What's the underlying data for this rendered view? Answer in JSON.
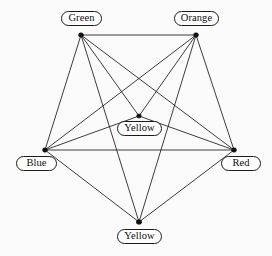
{
  "diagram": {
    "background_color": "#fbfbfb",
    "edge_color": "#1a1a1a",
    "node_color": "#111111",
    "label_border_color": "#1a1a1a",
    "label_fill_color": "#ffffff"
  },
  "nodes": [
    {
      "id": "green",
      "label": "Green",
      "x": 81,
      "y": 35,
      "label_x": 61,
      "label_y": 11,
      "label_w": 41,
      "label_h": 15,
      "dot_w": 5.0,
      "dot_h": 4.4
    },
    {
      "id": "orange",
      "label": "Orange",
      "x": 196,
      "y": 35,
      "label_x": 174,
      "label_y": 11,
      "label_w": 45,
      "label_h": 15,
      "dot_w": 5.0,
      "dot_h": 4.4
    },
    {
      "id": "yellow1",
      "label": "Yellow",
      "x": 139,
      "y": 116,
      "label_x": 117,
      "label_y": 121,
      "label_w": 45,
      "label_h": 15,
      "dot_w": 4.6,
      "dot_h": 4.2
    },
    {
      "id": "blue",
      "label": "Blue",
      "x": 45,
      "y": 150,
      "label_x": 16,
      "label_y": 156,
      "label_w": 41,
      "label_h": 15,
      "dot_w": 5.0,
      "dot_h": 4.4
    },
    {
      "id": "red",
      "label": "Red",
      "x": 234,
      "y": 150,
      "label_x": 221,
      "label_y": 156,
      "label_w": 40,
      "label_h": 15,
      "dot_w": 5.0,
      "dot_h": 4.4
    },
    {
      "id": "yellow2",
      "label": "Yellow",
      "x": 139,
      "y": 222,
      "label_x": 117,
      "label_y": 229,
      "label_w": 45,
      "label_h": 15,
      "dot_w": 5.4,
      "dot_h": 4.6
    }
  ],
  "edges": [
    {
      "from": "green",
      "to": "orange"
    },
    {
      "from": "green",
      "to": "blue"
    },
    {
      "from": "green",
      "to": "red"
    },
    {
      "from": "green",
      "to": "yellow1"
    },
    {
      "from": "green",
      "to": "yellow2"
    },
    {
      "from": "orange",
      "to": "blue"
    },
    {
      "from": "orange",
      "to": "red"
    },
    {
      "from": "orange",
      "to": "yellow1"
    },
    {
      "from": "orange",
      "to": "yellow2"
    },
    {
      "from": "blue",
      "to": "red"
    },
    {
      "from": "blue",
      "to": "yellow1"
    },
    {
      "from": "blue",
      "to": "yellow2"
    },
    {
      "from": "red",
      "to": "yellow1"
    },
    {
      "from": "red",
      "to": "yellow2"
    }
  ]
}
